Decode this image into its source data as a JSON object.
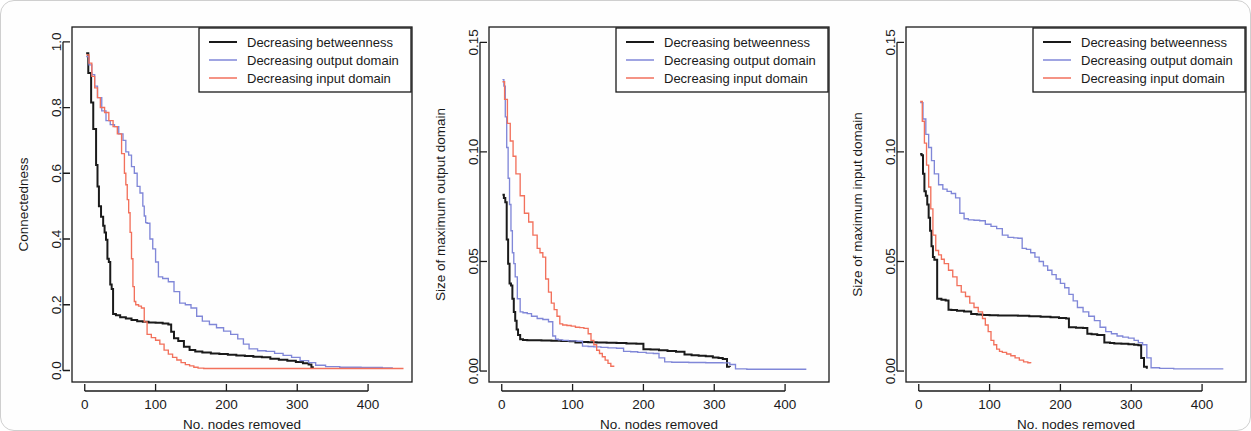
{
  "figure": {
    "panel_count": 3,
    "shared_xlabel": "No. nodes removed",
    "legend_entries": [
      {
        "label": "Decreasing betweenness",
        "color": "#1a1a1a"
      },
      {
        "label": "Decreasing output domain",
        "color": "#8087d8"
      },
      {
        "label": "Decreasing input domain",
        "color": "#f2715c"
      }
    ]
  },
  "colors": {
    "betweenness": "#1a1a1a",
    "output_domain": "#8087d8",
    "input_domain": "#f2715c",
    "axis": "#1a1a1a",
    "background": "#fefefe",
    "card_border": "#cfcfcf"
  },
  "chart_data": [
    {
      "type": "line",
      "title": "",
      "xlabel": "No. nodes removed",
      "ylabel": "Connectedness",
      "xlim": [
        -18,
        462
      ],
      "ylim": [
        -0.035,
        1.045
      ],
      "xticks": [
        0,
        100,
        200,
        300,
        400
      ],
      "xtick_labels": [
        "0",
        "100",
        "200",
        "300",
        "400"
      ],
      "yticks": [
        0.0,
        0.2,
        0.4,
        0.6,
        0.8,
        1.0
      ],
      "ytick_labels": [
        "0.0",
        "0.2",
        "0.4",
        "0.6",
        "0.8",
        "1.0"
      ],
      "grid": false,
      "legend_position": "top-right",
      "series": [
        {
          "name": "Decreasing betweenness",
          "color": "#1a1a1a",
          "x": [
            2,
            5,
            9,
            12,
            16,
            18,
            20,
            23,
            26,
            28,
            30,
            32,
            34,
            36,
            38,
            40,
            44,
            50,
            58,
            66,
            74,
            82,
            90,
            100,
            110,
            118,
            122,
            126,
            132,
            140,
            148,
            156,
            166,
            178,
            190,
            202,
            214,
            226,
            238,
            250,
            262,
            274,
            286,
            298,
            308,
            316,
            320,
            322
          ],
          "y": [
            0.965,
            0.905,
            0.815,
            0.735,
            0.625,
            0.56,
            0.5,
            0.468,
            0.44,
            0.42,
            0.398,
            0.34,
            0.33,
            0.262,
            0.248,
            0.172,
            0.168,
            0.162,
            0.158,
            0.154,
            0.15,
            0.148,
            0.146,
            0.145,
            0.143,
            0.14,
            0.118,
            0.098,
            0.09,
            0.072,
            0.062,
            0.058,
            0.055,
            0.052,
            0.05,
            0.048,
            0.046,
            0.044,
            0.042,
            0.04,
            0.036,
            0.033,
            0.03,
            0.026,
            0.022,
            0.018,
            0.01,
            0.006
          ]
        },
        {
          "name": "Decreasing output domain",
          "color": "#8087d8",
          "x": [
            2,
            6,
            10,
            14,
            18,
            24,
            30,
            36,
            42,
            48,
            54,
            58,
            62,
            66,
            70,
            74,
            78,
            82,
            84,
            86,
            88,
            92,
            96,
            100,
            104,
            110,
            118,
            126,
            134,
            142,
            150,
            158,
            166,
            176,
            186,
            196,
            206,
            216,
            224,
            232,
            244,
            256,
            268,
            280,
            292,
            304,
            316,
            326,
            340,
            360,
            390,
            420,
            435
          ],
          "y": [
            0.955,
            0.93,
            0.9,
            0.865,
            0.83,
            0.79,
            0.76,
            0.748,
            0.742,
            0.72,
            0.7,
            0.665,
            0.655,
            0.62,
            0.6,
            0.56,
            0.54,
            0.5,
            0.47,
            0.45,
            0.448,
            0.4,
            0.37,
            0.33,
            0.285,
            0.28,
            0.27,
            0.24,
            0.205,
            0.2,
            0.19,
            0.165,
            0.15,
            0.14,
            0.13,
            0.12,
            0.11,
            0.096,
            0.08,
            0.066,
            0.06,
            0.058,
            0.052,
            0.046,
            0.04,
            0.03,
            0.024,
            0.016,
            0.012,
            0.01,
            0.009,
            0.008,
            0.008
          ]
        },
        {
          "name": "Decreasing input domain",
          "color": "#f2715c",
          "x": [
            2,
            6,
            10,
            14,
            18,
            22,
            28,
            34,
            40,
            46,
            52,
            56,
            58,
            60,
            62,
            64,
            66,
            68,
            70,
            72,
            76,
            80,
            84,
            88,
            94,
            100,
            106,
            112,
            118,
            124,
            130,
            136,
            142,
            148,
            154,
            160,
            168,
            180,
            200,
            230,
            270,
            320,
            380,
            440,
            450
          ],
          "y": [
            0.96,
            0.935,
            0.895,
            0.86,
            0.83,
            0.8,
            0.785,
            0.76,
            0.742,
            0.72,
            0.66,
            0.6,
            0.565,
            0.52,
            0.48,
            0.42,
            0.34,
            0.255,
            0.21,
            0.2,
            0.196,
            0.19,
            0.148,
            0.11,
            0.1,
            0.092,
            0.08,
            0.062,
            0.05,
            0.04,
            0.032,
            0.024,
            0.018,
            0.014,
            0.01,
            0.007,
            0.006,
            0.006,
            0.006,
            0.006,
            0.006,
            0.006,
            0.006,
            0.006,
            0.006
          ]
        }
      ]
    },
    {
      "type": "line",
      "title": "",
      "xlabel": "No. nodes removed",
      "ylabel": "Size of maximum output domain",
      "xlim": [
        -18,
        462
      ],
      "ylim": [
        -0.005,
        0.157
      ],
      "xticks": [
        0,
        100,
        200,
        300,
        400
      ],
      "xtick_labels": [
        "0",
        "100",
        "200",
        "300",
        "400"
      ],
      "yticks": [
        0.0,
        0.05,
        0.1,
        0.15
      ],
      "ytick_labels": [
        "0.00",
        "0.05",
        "0.10",
        "0.15"
      ],
      "grid": false,
      "legend_position": "top-right",
      "series": [
        {
          "name": "Decreasing betweenness",
          "color": "#1a1a1a",
          "x": [
            1,
            3,
            5,
            7,
            9,
            11,
            13,
            15,
            17,
            19,
            21,
            23,
            26,
            30,
            36,
            44,
            56,
            70,
            84,
            96,
            104,
            112,
            122,
            134,
            148,
            162,
            176,
            190,
            200,
            210,
            222,
            234,
            246,
            258,
            268,
            278,
            288,
            298,
            306,
            312,
            318,
            322
          ],
          "y": [
            0.0805,
            0.079,
            0.077,
            0.06,
            0.049,
            0.04,
            0.039,
            0.033,
            0.027,
            0.023,
            0.019,
            0.0165,
            0.0145,
            0.0142,
            0.014,
            0.014,
            0.0139,
            0.0138,
            0.0137,
            0.0136,
            0.013,
            0.0132,
            0.0131,
            0.013,
            0.0129,
            0.0128,
            0.0126,
            0.0124,
            0.01,
            0.0098,
            0.0095,
            0.0092,
            0.0088,
            0.0075,
            0.0072,
            0.007,
            0.0068,
            0.0062,
            0.006,
            0.0055,
            0.002,
            0.0018
          ]
        },
        {
          "name": "Decreasing output domain",
          "color": "#8087d8",
          "x": [
            1,
            3,
            5,
            7,
            9,
            11,
            13,
            15,
            17,
            19,
            22,
            26,
            30,
            36,
            42,
            50,
            58,
            66,
            72,
            76,
            80,
            86,
            94,
            100,
            106,
            114,
            122,
            130,
            140,
            150,
            162,
            172,
            182,
            192,
            204,
            214,
            222,
            230,
            240,
            252,
            264,
            276,
            288,
            300,
            312,
            322,
            330,
            346,
            370,
            400,
            430
          ],
          "y": [
            0.133,
            0.13,
            0.116,
            0.102,
            0.088,
            0.076,
            0.064,
            0.054,
            0.049,
            0.043,
            0.033,
            0.027,
            0.0266,
            0.0262,
            0.025,
            0.024,
            0.0235,
            0.0225,
            0.016,
            0.0145,
            0.0142,
            0.014,
            0.0138,
            0.0138,
            0.0136,
            0.0114,
            0.0112,
            0.011,
            0.0108,
            0.0106,
            0.0104,
            0.009,
            0.0088,
            0.0085,
            0.0082,
            0.008,
            0.006,
            0.0042,
            0.004,
            0.004,
            0.0039,
            0.0039,
            0.0038,
            0.0038,
            0.0037,
            0.003,
            0.001,
            0.0008,
            0.0008,
            0.0008,
            0.0008
          ]
        },
        {
          "name": "Decreasing input domain",
          "color": "#f2715c",
          "x": [
            1,
            4,
            8,
            12,
            16,
            20,
            26,
            32,
            38,
            44,
            50,
            54,
            58,
            62,
            66,
            70,
            74,
            78,
            82,
            86,
            92,
            98,
            104,
            110,
            116,
            122,
            126,
            130,
            134,
            138,
            142,
            146,
            150,
            154,
            158
          ],
          "y": [
            0.132,
            0.124,
            0.113,
            0.105,
            0.098,
            0.09,
            0.08,
            0.072,
            0.068,
            0.062,
            0.056,
            0.054,
            0.052,
            0.042,
            0.036,
            0.031,
            0.028,
            0.025,
            0.0215,
            0.021,
            0.0208,
            0.0205,
            0.02,
            0.0198,
            0.0195,
            0.017,
            0.014,
            0.012,
            0.0095,
            0.008,
            0.0065,
            0.005,
            0.0035,
            0.0022,
            0.0018
          ]
        }
      ]
    },
    {
      "type": "line",
      "title": "",
      "xlabel": "No. nodes removed",
      "ylabel": "Size of maximum input domain",
      "xlim": [
        -18,
        462
      ],
      "ylim": [
        -0.005,
        0.157
      ],
      "xticks": [
        0,
        100,
        200,
        300,
        400
      ],
      "xtick_labels": [
        "0",
        "100",
        "200",
        "300",
        "400"
      ],
      "yticks": [
        0.0,
        0.05,
        0.1,
        0.15
      ],
      "ytick_labels": [
        "0.00",
        "0.05",
        "0.10",
        "0.15"
      ],
      "grid": false,
      "legend_position": "top-right",
      "series": [
        {
          "name": "Decreasing betweenness",
          "color": "#1a1a1a",
          "x": [
            2,
            4,
            6,
            8,
            10,
            12,
            14,
            16,
            18,
            20,
            22,
            26,
            32,
            38,
            42,
            46,
            54,
            64,
            74,
            82,
            90,
            100,
            112,
            126,
            140,
            156,
            172,
            186,
            198,
            208,
            212,
            222,
            232,
            238,
            244,
            252,
            262,
            270,
            276,
            286,
            296,
            304,
            310,
            314,
            318,
            322
          ],
          "y": [
            0.099,
            0.0985,
            0.09,
            0.082,
            0.08,
            0.076,
            0.07,
            0.064,
            0.057,
            0.052,
            0.0508,
            0.033,
            0.0325,
            0.0322,
            0.028,
            0.0278,
            0.0275,
            0.0272,
            0.026,
            0.0258,
            0.0256,
            0.0255,
            0.0254,
            0.0253,
            0.0252,
            0.025,
            0.0248,
            0.0245,
            0.0242,
            0.024,
            0.02,
            0.0198,
            0.0196,
            0.017,
            0.0168,
            0.0165,
            0.013,
            0.0128,
            0.0126,
            0.0124,
            0.0122,
            0.012,
            0.0118,
            0.006,
            0.002,
            0.001
          ]
        },
        {
          "name": "Decreasing output domain",
          "color": "#8087d8",
          "x": [
            2,
            6,
            10,
            14,
            18,
            22,
            28,
            34,
            40,
            46,
            52,
            58,
            64,
            70,
            78,
            86,
            94,
            102,
            110,
            118,
            126,
            134,
            140,
            146,
            152,
            158,
            164,
            170,
            176,
            182,
            188,
            194,
            200,
            206,
            212,
            218,
            224,
            232,
            240,
            248,
            256,
            264,
            272,
            280,
            288,
            296,
            304,
            310,
            316,
            322,
            328,
            340,
            360,
            390,
            430
          ],
          "y": [
            0.1225,
            0.115,
            0.108,
            0.102,
            0.096,
            0.09,
            0.085,
            0.083,
            0.082,
            0.081,
            0.079,
            0.072,
            0.0695,
            0.069,
            0.0688,
            0.0686,
            0.067,
            0.066,
            0.065,
            0.062,
            0.061,
            0.0608,
            0.0606,
            0.056,
            0.0555,
            0.054,
            0.052,
            0.05,
            0.048,
            0.046,
            0.044,
            0.042,
            0.04,
            0.038,
            0.035,
            0.032,
            0.029,
            0.027,
            0.025,
            0.023,
            0.02,
            0.018,
            0.017,
            0.016,
            0.0155,
            0.015,
            0.014,
            0.013,
            0.012,
            0.006,
            0.0015,
            0.0012,
            0.001,
            0.001,
            0.001
          ]
        },
        {
          "name": "Decreasing input domain",
          "color": "#f2715c",
          "x": [
            2,
            5,
            8,
            11,
            14,
            17,
            20,
            24,
            28,
            32,
            36,
            42,
            48,
            54,
            60,
            66,
            72,
            78,
            84,
            90,
            94,
            98,
            102,
            106,
            110,
            114,
            118,
            124,
            130,
            136,
            142,
            148,
            154,
            158
          ],
          "y": [
            0.123,
            0.114,
            0.104,
            0.094,
            0.084,
            0.074,
            0.062,
            0.055,
            0.053,
            0.051,
            0.049,
            0.046,
            0.043,
            0.039,
            0.036,
            0.034,
            0.031,
            0.029,
            0.027,
            0.024,
            0.021,
            0.018,
            0.014,
            0.012,
            0.01,
            0.009,
            0.0085,
            0.0078,
            0.007,
            0.006,
            0.005,
            0.0042,
            0.0038,
            0.0035
          ]
        }
      ]
    }
  ]
}
